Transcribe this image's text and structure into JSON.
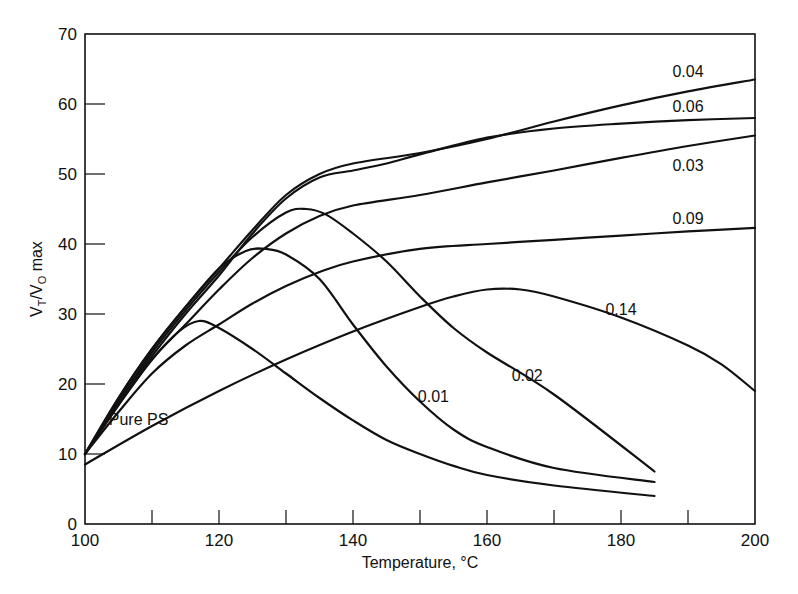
{
  "chart_data": {
    "type": "line",
    "title": "",
    "xlabel": "Temperature, °C",
    "ylabel": "V_T / V_0 max",
    "ylabel_parts": {
      "v1": "V",
      "sub1": "T",
      "slash": "/",
      "v2": "V",
      "sub2": "O",
      "suffix": " max"
    },
    "xlim": [
      100,
      200
    ],
    "ylim": [
      0,
      70
    ],
    "x_ticks_major": [
      100,
      120,
      140,
      160,
      180,
      200
    ],
    "x_ticks_minor": [
      110,
      130,
      150,
      170,
      190
    ],
    "y_ticks": [
      0,
      10,
      20,
      30,
      40,
      50,
      60,
      70
    ],
    "grid": false,
    "legend": "inline curve labels",
    "series": [
      {
        "name": "Pure PS",
        "label_pos": [
          108,
          14.2
        ],
        "x": [
          100,
          105,
          110,
          114,
          117,
          120,
          125,
          130,
          135,
          140,
          145,
          150,
          155,
          160,
          170,
          185
        ],
        "y": [
          10,
          17,
          23.5,
          27.5,
          29,
          28,
          25,
          21.5,
          18,
          14.8,
          12,
          10,
          8.3,
          7,
          5.5,
          4
        ]
      },
      {
        "name": "0.01",
        "label_pos": [
          152,
          17.5
        ],
        "x": [
          100,
          105,
          110,
          115,
          120,
          124,
          127,
          130,
          135,
          140,
          145,
          150,
          155,
          160,
          170,
          185
        ],
        "y": [
          10,
          18,
          25,
          31,
          36.5,
          39,
          39.3,
          38.5,
          35,
          28.5,
          22.5,
          17.5,
          13.5,
          11,
          8,
          6
        ]
      },
      {
        "name": "0.02",
        "label_pos": [
          166,
          20.5
        ],
        "x": [
          100,
          105,
          110,
          115,
          120,
          125,
          130,
          133,
          136,
          140,
          145,
          150,
          155,
          160,
          170,
          185
        ],
        "y": [
          10,
          17.5,
          24.5,
          30.5,
          36,
          41,
          44.5,
          45,
          44.2,
          41.5,
          37.5,
          32.5,
          28,
          24.5,
          18.5,
          7.5
        ]
      },
      {
        "name": "0.03",
        "label_pos": [
          190,
          50.5
        ],
        "x": [
          100,
          105,
          110,
          115,
          120,
          125,
          130,
          135,
          140,
          150,
          160,
          170,
          180,
          190,
          200
        ],
        "y": [
          10,
          17,
          23.5,
          28.5,
          33.5,
          38,
          41.5,
          44,
          45.5,
          47,
          48.8,
          50.5,
          52.3,
          54,
          55.5
        ]
      },
      {
        "name": "0.04",
        "label_pos": [
          190,
          63.8
        ],
        "x": [
          100,
          105,
          110,
          115,
          120,
          125,
          130,
          135,
          140,
          150,
          160,
          170,
          180,
          190,
          200
        ],
        "y": [
          10,
          18,
          25,
          31,
          36.5,
          42,
          47,
          50,
          51.5,
          53,
          55,
          57.5,
          59.8,
          61.8,
          63.5
        ]
      },
      {
        "name": "0.06",
        "label_pos": [
          190,
          58.8
        ],
        "x": [
          100,
          105,
          110,
          115,
          120,
          125,
          130,
          135,
          140,
          145,
          150,
          160,
          170,
          180,
          190,
          200
        ],
        "y": [
          10,
          17.5,
          24,
          30,
          35.5,
          41.5,
          46.5,
          49.5,
          50.5,
          51.5,
          52.8,
          55.2,
          56.5,
          57.2,
          57.7,
          58
        ]
      },
      {
        "name": "0.09",
        "label_pos": [
          190,
          42.8
        ],
        "x": [
          100,
          105,
          110,
          115,
          120,
          125,
          130,
          135,
          140,
          150,
          160,
          170,
          180,
          190,
          200
        ],
        "y": [
          10,
          16,
          21.5,
          25.5,
          28.5,
          31.5,
          34,
          36,
          37.5,
          39.3,
          40,
          40.6,
          41.2,
          41.8,
          42.3
        ]
      },
      {
        "name": "0.14",
        "label_pos": [
          180,
          29.8
        ],
        "x": [
          100,
          110,
          120,
          130,
          140,
          150,
          155,
          160,
          165,
          170,
          180,
          190,
          195,
          200
        ],
        "y": [
          8.5,
          14,
          19,
          23.5,
          27.5,
          31,
          32.5,
          33.5,
          33.5,
          32.5,
          29.5,
          25.5,
          22.8,
          19
        ]
      }
    ]
  }
}
